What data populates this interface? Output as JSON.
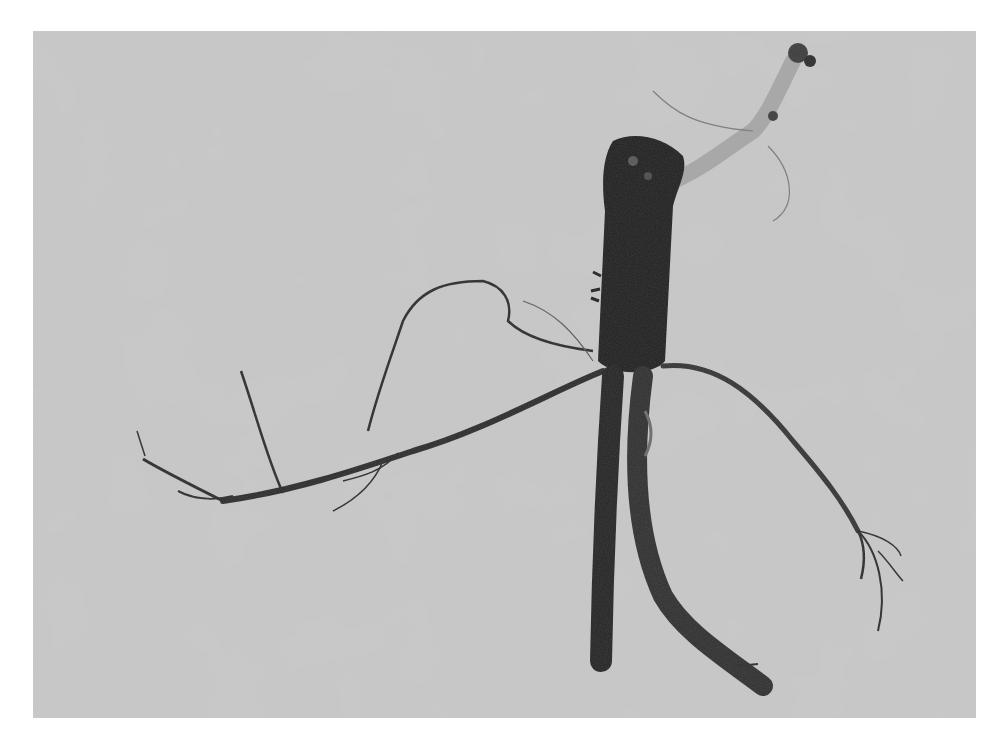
{
  "image": {
    "subject": "Root cutting with adventitious lateral roots",
    "description": "Grayscale photograph of a dark, thick plant root segment with a pale upper stem branch, several fibrous lateral roots spreading left and right, and two thick roots descending, on a mottled gray background",
    "colors": {
      "page": "#ffffff",
      "background": "#c9c9c9",
      "root_dark": "#1e1e1e",
      "root_mid": "#3a3a3a",
      "stem_pale": "#a8a8a8",
      "fine_root": "#2a2a2a"
    }
  },
  "caption": {
    "text": ""
  }
}
